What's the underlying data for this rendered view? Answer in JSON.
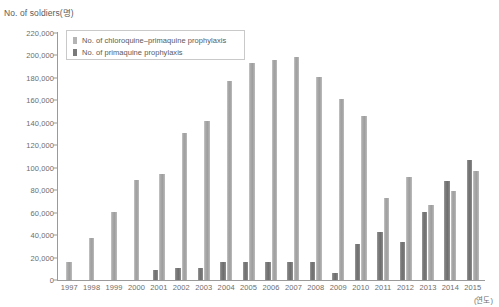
{
  "chart_data": {
    "type": "bar",
    "title": "",
    "ylabel": "No. of soldiers(명)",
    "xlabel": "(연도)",
    "ylim": [
      0,
      220000
    ],
    "ytick_step": 20000,
    "grid": false,
    "legend_position": "top-left-inside",
    "categories": [
      "1997",
      "1998",
      "1999",
      "2000",
      "2001",
      "2002",
      "2003",
      "2004",
      "2005",
      "2006",
      "2007",
      "2008",
      "2009",
      "2010",
      "2011",
      "2012",
      "2013",
      "2014",
      "2015"
    ],
    "series": [
      {
        "name": "No. of primaquine prophylaxis",
        "color": "#7a7a7a",
        "values": [
          0,
          0,
          0,
          0,
          9000,
          11000,
          11000,
          16000,
          16000,
          16000,
          16000,
          16000,
          6000,
          32000,
          43000,
          34000,
          61000,
          88000,
          107000
        ]
      },
      {
        "name": "No. of chloroquine–primaquine prophylaxis",
        "color": "#b4b4b4",
        "values": [
          16000,
          37000,
          61000,
          89000,
          94000,
          131000,
          142000,
          177000,
          193000,
          196000,
          199000,
          181000,
          161000,
          146000,
          73000,
          92000,
          67000,
          79000,
          97000
        ]
      }
    ],
    "ytick_labels": [
      "0",
      "20,000",
      "40,000",
      "60,000",
      "80,000",
      "100,000",
      "120,000",
      "140,000",
      "160,000",
      "180,000",
      "200,000",
      "220,000"
    ]
  },
  "legend": {
    "items": [
      {
        "label": "No. of chloroquine–primaquine prophylaxis",
        "swatch": "light"
      },
      {
        "label": "No. of primaquine prophylaxis",
        "swatch": "dark"
      }
    ]
  }
}
